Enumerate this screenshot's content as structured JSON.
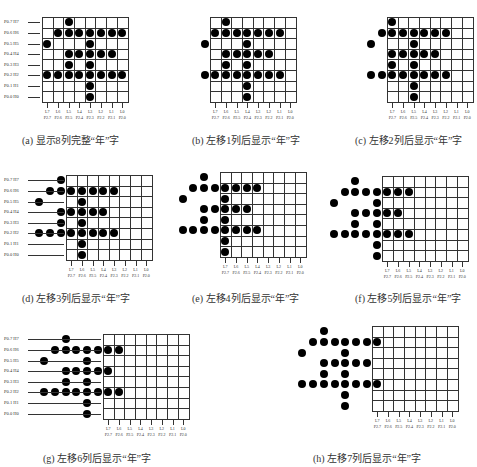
{
  "figure": {
    "glyph": "年",
    "rows": 8,
    "cols": 8,
    "row_labels": [
      "P0.7  H7",
      "P0.6  H6",
      "P0.5  H5",
      "P0.4  H4",
      "P0.3  H3",
      "P0.2  H2",
      "P0.1  H1",
      "P0.0  H0"
    ],
    "col_labels_top": [
      "L7",
      "L6",
      "L5",
      "L4",
      "L3",
      "L2",
      "L1",
      "L0"
    ],
    "col_labels_bottom": [
      "P2.7",
      "P2.6",
      "P2.5",
      "P2.4",
      "P2.3",
      "P2.2",
      "P2.1",
      "P2.0"
    ],
    "pattern": [
      [
        2
      ],
      [
        1,
        2,
        3,
        4,
        5,
        6,
        7
      ],
      [
        0,
        4
      ],
      [
        2,
        3,
        4,
        5,
        6
      ],
      [
        2,
        4
      ],
      [
        0,
        1,
        2,
        3,
        4,
        5,
        6,
        7
      ],
      [
        4
      ],
      [
        4
      ]
    ]
  },
  "panels": [
    {
      "id": "a",
      "caption": "(a) 显示8列完整“年”字",
      "shift": 0,
      "x": 42,
      "y": 17,
      "show_row_labels": true,
      "caption_x": 22,
      "caption_y": 132
    },
    {
      "id": "b",
      "caption": "(b) 左移1列后显示“年”字",
      "shift": 1,
      "x": 210,
      "y": 17,
      "show_row_labels": false,
      "caption_x": 192,
      "caption_y": 132
    },
    {
      "id": "c",
      "caption": "(c) 左移2列后显示“年”字",
      "shift": 2,
      "x": 387,
      "y": 17,
      "show_row_labels": false,
      "caption_x": 355,
      "caption_y": 132
    },
    {
      "id": "d",
      "caption": "(d) 左移3列后显示“年”字",
      "shift": 3,
      "x": 66,
      "y": 175,
      "show_row_labels": true,
      "caption_x": 22,
      "caption_y": 290
    },
    {
      "id": "e",
      "caption": "(e) 左移4列后显示“年”字",
      "shift": 4,
      "x": 220,
      "y": 172,
      "show_row_labels": false,
      "caption_x": 192,
      "caption_y": 290
    },
    {
      "id": "f",
      "caption": "(f) 左移5列后显示“年”字",
      "shift": 5,
      "x": 382,
      "y": 176,
      "show_row_labels": false,
      "caption_x": 355,
      "caption_y": 290
    },
    {
      "id": "g",
      "caption": "(g) 左移6列后显示“年”字",
      "shift": 6,
      "x": 103,
      "y": 334,
      "show_row_labels": true,
      "caption_x": 43,
      "caption_y": 450
    },
    {
      "id": "h",
      "caption": "(h) 左移7列后显示“年”字",
      "shift": 7,
      "x": 372,
      "y": 326,
      "show_row_labels": false,
      "caption_x": 313,
      "caption_y": 450
    }
  ],
  "colors": {
    "dot": "#000000",
    "grid_line": "#333333",
    "background": "#ffffff"
  }
}
